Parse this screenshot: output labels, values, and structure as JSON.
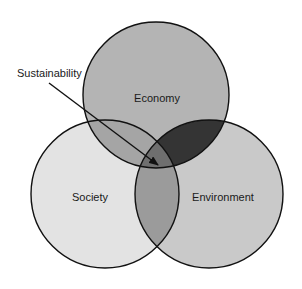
{
  "diagram": {
    "type": "venn",
    "callout": {
      "label": "Sustainability",
      "points_to": "intersection of Economy, Society and Environment"
    },
    "sets": [
      {
        "id": "economy",
        "label": "Economy",
        "color": "#b4b4b4"
      },
      {
        "id": "society",
        "label": "Society",
        "color": "#e3e3e3"
      },
      {
        "id": "environment",
        "label": "Environment",
        "color": "#c9c9c9"
      }
    ],
    "overlaps": {
      "economy_society": {
        "color": "#a5a5a5"
      },
      "economy_environment": {
        "color": "#343434"
      },
      "society_environment": {
        "color": "#9b9b9b"
      },
      "all_three": {
        "color": "#6f6f6f"
      }
    },
    "outline_color": "#111111"
  }
}
